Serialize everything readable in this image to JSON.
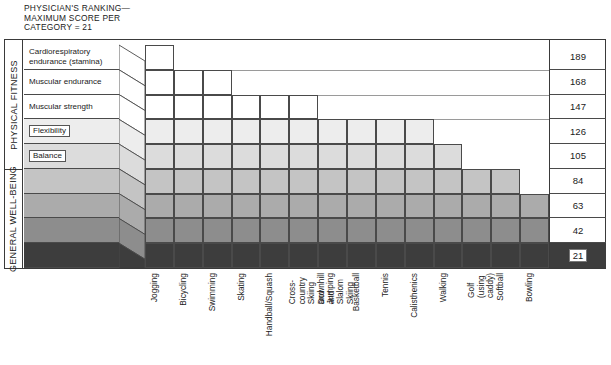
{
  "title": "PHYSICIAN'S RANKING—\nMAXIMUM SCORE PER\nCATEGORY = 21",
  "sections": [
    {
      "label": "PHYSICAL FITNESS",
      "rows": 5
    },
    {
      "label": "GENERAL WELL-BEING",
      "rows": 4
    }
  ],
  "categories": [
    {
      "label": "Cardiorespiratory\nendurance (stamina)",
      "boxed": false
    },
    {
      "label": "Muscular endurance",
      "boxed": false
    },
    {
      "label": "Muscular strength",
      "boxed": false
    },
    {
      "label": "Flexibility",
      "boxed": true
    },
    {
      "label": "Balance",
      "boxed": true
    },
    {
      "label": "",
      "boxed": false
    },
    {
      "label": "",
      "boxed": false
    },
    {
      "label": "",
      "boxed": false
    },
    {
      "label": "",
      "boxed": false
    }
  ],
  "scale_values": [
    "189",
    "168",
    "147",
    "126",
    "105",
    "84",
    "63",
    "42",
    "21"
  ],
  "highlighted_scale_value": "21",
  "unit": 21,
  "chart_data": {
    "type": "bar",
    "xlabel": "",
    "ylabel": "",
    "ylim": [
      0,
      189
    ],
    "grid": true,
    "legend": "none",
    "yticklabels": [
      "21",
      "42",
      "63",
      "84",
      "105",
      "126",
      "147",
      "168",
      "189"
    ],
    "categories": [
      "Jogging",
      "Bicycling",
      "Swimming",
      "Skating",
      "Handball/Squash",
      "Cross-country Skiing\nand Jumping",
      "Downhill and Slalom\nSkiing",
      "Basketball",
      "Tennis",
      "Calisthenics",
      "Walking",
      "Golf (using caddy)",
      "Softball",
      "Bowling"
    ],
    "values": [
      189,
      168,
      168,
      147,
      147,
      147,
      126,
      126,
      126,
      126,
      105,
      84,
      84,
      63
    ],
    "stack_counts": [
      9,
      8,
      8,
      7,
      7,
      7,
      6,
      6,
      6,
      6,
      5,
      4,
      4,
      3
    ],
    "row_categories_bottom_to_top": [
      "General well-being row 4",
      "General well-being row 3",
      "General well-being row 2",
      "General well-being row 1",
      "Balance",
      "Flexibility",
      "Muscular strength",
      "Muscular endurance",
      "Cardiorespiratory endurance (stamina)"
    ]
  },
  "shades_top_to_bottom": [
    "#ffffff",
    "#ffffff",
    "#ffffff",
    "#ededed",
    "#dcdcdc",
    "#c4c4c4",
    "#ababab",
    "#8d8d8d",
    "#3d3d3d"
  ],
  "colors": {
    "border": "#3a3a3a",
    "cell_border": "#4a4a4a",
    "guide": "#9a9a9a",
    "text": "#1a1a1a",
    "darkest_band": "#3d3d3d"
  }
}
